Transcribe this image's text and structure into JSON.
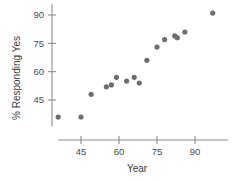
{
  "chart_data": {
    "type": "scatter",
    "title": "",
    "xlabel": "Year",
    "ylabel": "% Responding Yes",
    "xlim": [
      30,
      102
    ],
    "ylim": [
      30,
      96
    ],
    "xticks": [
      45,
      60,
      75,
      90
    ],
    "xticklabels": [
      "45",
      "60",
      "75",
      "90"
    ],
    "yticks": [
      45,
      60,
      75,
      90
    ],
    "yticklabels": [
      "45",
      "60",
      "75",
      "90"
    ],
    "grid": false,
    "legend": false,
    "marker": "filled-circle",
    "marker_color": "#6e6e6e",
    "axis_color": "#8c8c8c",
    "x": [
      36,
      45,
      49,
      55,
      57,
      59,
      63,
      66,
      68,
      71,
      75,
      78,
      82,
      83,
      86,
      97
    ],
    "y": [
      36,
      36,
      48,
      52,
      53,
      57,
      55,
      57,
      54,
      66,
      73,
      77,
      79,
      78,
      81,
      91
    ],
    "points": [
      {
        "x": 36,
        "y": 36
      },
      {
        "x": 45,
        "y": 36
      },
      {
        "x": 49,
        "y": 48
      },
      {
        "x": 55,
        "y": 52
      },
      {
        "x": 57,
        "y": 53
      },
      {
        "x": 59,
        "y": 57
      },
      {
        "x": 63,
        "y": 55
      },
      {
        "x": 66,
        "y": 57
      },
      {
        "x": 68,
        "y": 54
      },
      {
        "x": 71,
        "y": 66
      },
      {
        "x": 75,
        "y": 73
      },
      {
        "x": 78,
        "y": 77
      },
      {
        "x": 82,
        "y": 79
      },
      {
        "x": 83,
        "y": 78
      },
      {
        "x": 86,
        "y": 81
      },
      {
        "x": 97,
        "y": 91
      }
    ]
  }
}
